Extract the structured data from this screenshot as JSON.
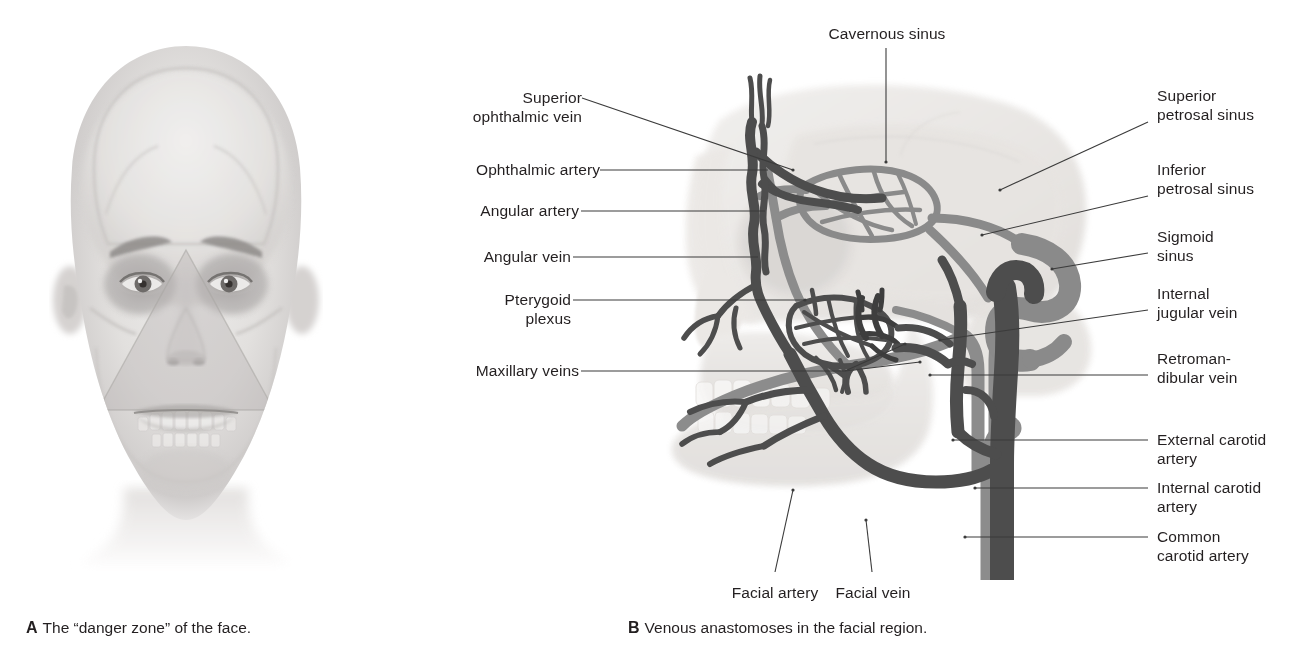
{
  "figure": {
    "panels": [
      {
        "id": "A",
        "letter": "A",
        "caption": "The “danger zone” of the face.",
        "description": "Frontal view of a man's face with a translucent skull superimposed and a shaded triangular “danger zone” spanning from the bridge of the nose to the corners of the mouth."
      },
      {
        "id": "B",
        "letter": "B",
        "caption": "Venous anastomoses in the facial region.",
        "description": "Left lateral view of the skull with the facial veins, dural venous sinuses and carotid arteries drawn in."
      }
    ]
  },
  "labels": {
    "top": [
      {
        "key": "cavernous_sinus",
        "text": "Cavernous sinus",
        "align": "center"
      }
    ],
    "left": [
      {
        "key": "superior_ophthalmic_vein",
        "text": "Superior\nophthalmic vein",
        "align": "right"
      },
      {
        "key": "ophthalmic_artery",
        "text": "Ophthalmic artery",
        "align": "right"
      },
      {
        "key": "angular_artery",
        "text": "Angular artery",
        "align": "right"
      },
      {
        "key": "angular_vein",
        "text": "Angular vein",
        "align": "right"
      },
      {
        "key": "pterygoid_plexus",
        "text": "Pterygoid\nplexus",
        "align": "right"
      },
      {
        "key": "maxillary_veins",
        "text": "Maxillary veins",
        "align": "right"
      }
    ],
    "right": [
      {
        "key": "superior_petrosal_sinus",
        "text": "Superior\npetrosal sinus",
        "align": "left"
      },
      {
        "key": "inferior_petrosal_sinus",
        "text": "Inferior\npetrosal sinus",
        "align": "left"
      },
      {
        "key": "sigmoid_sinus",
        "text": "Sigmoid\nsinus",
        "align": "left"
      },
      {
        "key": "internal_jugular_vein",
        "text": "Internal\njugular vein",
        "align": "left"
      },
      {
        "key": "retromandibular_vein",
        "text": "Retroman-\ndibular vein",
        "align": "left"
      },
      {
        "key": "external_carotid_artery",
        "text": "External carotid artery",
        "align": "left"
      },
      {
        "key": "internal_carotid_artery",
        "text": "Internal carotid artery",
        "align": "left"
      },
      {
        "key": "common_carotid_artery",
        "text": "Common\ncarotid artery",
        "align": "left"
      }
    ],
    "bottom": [
      {
        "key": "facial_artery",
        "text": "Facial artery",
        "align": "center"
      },
      {
        "key": "facial_vein",
        "text": "Facial vein",
        "align": "center"
      }
    ]
  },
  "colors": {
    "text": "#231f20",
    "leader_line": "#3b3b3b",
    "vein_dark": "#4d4d4d",
    "vein_mid": "#5a5a5a",
    "artery_gray": "#8c8c8c",
    "sinus_gray": "#878787",
    "skull_bone": "#e8e6e4",
    "skull_bone_shadow": "#d8d5d2",
    "skull_outline": "#cfcccb",
    "face_skin": "#dcdad8",
    "face_shadow": "#b9b6b4",
    "danger_zone": "#c9c6c4",
    "background": "#ffffff"
  },
  "vessel_legend": [
    {
      "name": "veins and dural venous sinuses",
      "tone": "dark gray"
    },
    {
      "name": "arteries",
      "tone": "medium gray"
    }
  ]
}
